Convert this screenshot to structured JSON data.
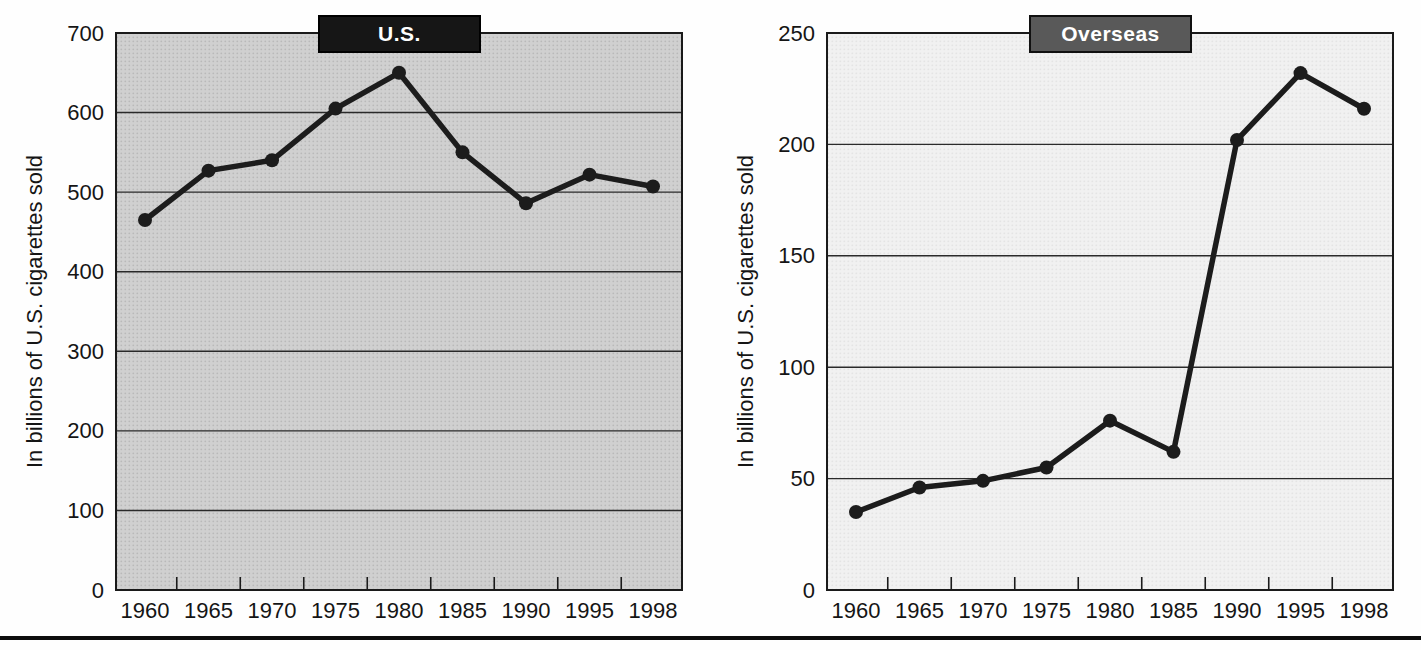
{
  "page": {
    "background": "#fefefe",
    "bottom_rule_color": "#0d0d0d"
  },
  "chart_data": [
    {
      "type": "line",
      "title": "U.S.",
      "categories": [
        "1960",
        "1965",
        "1970",
        "1975",
        "1980",
        "1985",
        "1990",
        "1995",
        "1998"
      ],
      "values": [
        465,
        527,
        540,
        605,
        650,
        550,
        486,
        522,
        507
      ],
      "xlabel": "",
      "ylabel": "In billions of U.S. cigarettes sold",
      "ylim": [
        0,
        700
      ],
      "yticks": [
        0,
        100,
        200,
        300,
        400,
        500,
        600,
        700
      ],
      "grid": true,
      "legend_position": "none",
      "style": {
        "title_bg": "#161616",
        "title_border": "#000000",
        "title_color": "#ffffff",
        "plot_bg": "#d0d0d0",
        "plot_dot": "#b9b9b9",
        "line_color": "#1c1c1c",
        "marker_color": "#1c1c1c",
        "grid_color": "#2a2a2a",
        "frame_color": "#1a1a1a",
        "text_color": "#151515"
      }
    },
    {
      "type": "line",
      "title": "Overseas",
      "categories": [
        "1960",
        "1965",
        "1970",
        "1975",
        "1980",
        "1985",
        "1990",
        "1995",
        "1998"
      ],
      "values": [
        35,
        46,
        49,
        55,
        76,
        62,
        202,
        232,
        216
      ],
      "xlabel": "",
      "ylabel": "In billions of U.S. cigarettes sold",
      "ylim": [
        0,
        250
      ],
      "yticks": [
        0,
        50,
        100,
        150,
        200,
        250
      ],
      "grid": true,
      "legend_position": "none",
      "style": {
        "title_bg": "#595959",
        "title_border": "#111111",
        "title_color": "#ffffff",
        "plot_bg": "#f1f1f1",
        "plot_dot": "#e4e4e4",
        "line_color": "#1c1c1c",
        "marker_color": "#1c1c1c",
        "grid_color": "#2a2a2a",
        "frame_color": "#1a1a1a",
        "text_color": "#151515"
      }
    }
  ]
}
